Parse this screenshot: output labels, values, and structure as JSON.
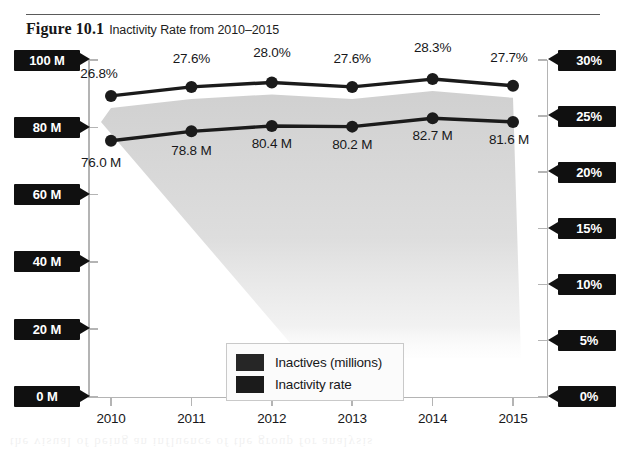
{
  "figure": {
    "label": "Figure 10.1",
    "title": "Inactivity Rate from 2010–2015"
  },
  "legend": {
    "items": [
      {
        "label": "Inactives (millions)",
        "color": "#262626"
      },
      {
        "label": "Inactivity rate",
        "color": "#1b1b1b"
      }
    ]
  },
  "axes": {
    "left_ticks": [
      "0 M",
      "20 M",
      "40 M",
      "60 M",
      "80 M",
      "100 M"
    ],
    "right_ticks": [
      "0%",
      "5%",
      "10%",
      "15%",
      "20%",
      "25%",
      "30%"
    ],
    "x_ticks": [
      "2010",
      "2011",
      "2012",
      "2013",
      "2014",
      "2015"
    ]
  },
  "chart_data": {
    "type": "line",
    "title": "Inactivity Rate from 2010–2015",
    "xlabel": "",
    "ylabel": "Inactives (millions)",
    "y2label": "Inactivity rate",
    "x": [
      2010,
      2011,
      2012,
      2013,
      2014,
      2015
    ],
    "categories": [
      "2010",
      "2011",
      "2012",
      "2013",
      "2014",
      "2015"
    ],
    "ylim": [
      0,
      100
    ],
    "y2lim": [
      0,
      30
    ],
    "grid": false,
    "legend_position": "inside-lower-left",
    "series": [
      {
        "name": "Inactives (millions)",
        "axis": "left",
        "unit": "M",
        "color": "#1b1b1b",
        "values": [
          76.0,
          78.8,
          80.4,
          80.2,
          82.7,
          81.6
        ],
        "labels": [
          "76.0 M",
          "78.8 M",
          "80.4 M",
          "80.2 M",
          "82.7 M",
          "81.6 M"
        ]
      },
      {
        "name": "Inactivity rate",
        "axis": "right",
        "unit": "%",
        "color": "#1b1b1b",
        "values": [
          26.8,
          27.6,
          28.0,
          27.6,
          28.3,
          27.7
        ],
        "labels": [
          "26.8%",
          "27.6%",
          "28.0%",
          "27.6%",
          "28.3%",
          "27.7%"
        ]
      }
    ]
  },
  "ghost": "the visual of being an influence of the group for analysis"
}
